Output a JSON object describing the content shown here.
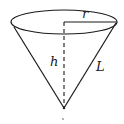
{
  "diagram": {
    "labels": {
      "radius": "r",
      "height": "h",
      "slant_height": "L"
    },
    "colors": {
      "stroke": "#1a1a1a",
      "background": "#ffffff"
    }
  }
}
